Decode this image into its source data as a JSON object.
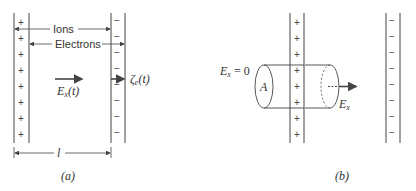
{
  "figure_a": {
    "caption": "(a)",
    "ions_label": "Ions",
    "electrons_label": "Electrons",
    "field_label": "E",
    "field_sub": "x",
    "field_arg": "(t)",
    "displacement_label": "ζ",
    "displacement_sub": "e",
    "displacement_arg": "(t)",
    "length_label": "l",
    "left_plate_sign": "+",
    "right_plate_sign": "−",
    "sign_count": 8
  },
  "figure_b": {
    "caption": "(b)",
    "field_zero_label": "E",
    "field_zero_sub": "x",
    "field_zero_value": " = 0",
    "area_label": "A",
    "field_label": "E",
    "field_sub": "x",
    "left_plate_sign": "+",
    "right_plate_sign": "−",
    "sign_count": 8
  },
  "colors": {
    "line": "#444444",
    "text": "#333333",
    "background": "#ffffff"
  }
}
